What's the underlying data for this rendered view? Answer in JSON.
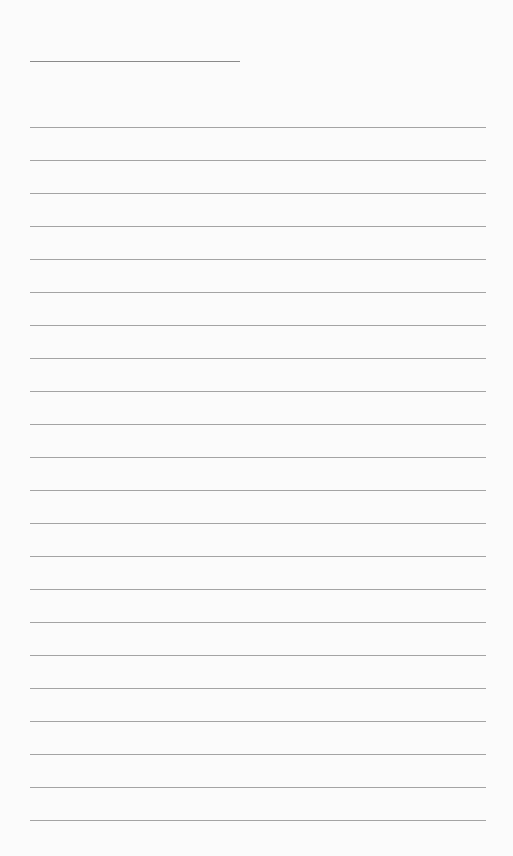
{
  "page": {
    "type": "lined-notepad",
    "background_color": "#fbfbfb",
    "line_color": "#a4a4a4",
    "title_line": {
      "x": 30,
      "y": 61,
      "width": 210
    },
    "ruled_lines": {
      "count": 22,
      "x": 30,
      "width": 456,
      "first_y": 127,
      "spacing": 33
    }
  }
}
